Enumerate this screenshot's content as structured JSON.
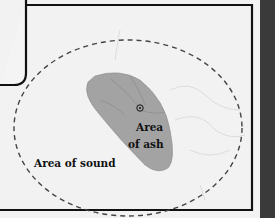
{
  "map": {
    "labels": {
      "sound_area": "Area of sound",
      "ash_area_line1": "Area",
      "ash_area_line2": "of ash"
    },
    "icons": {
      "volcano": "volcano-marker-icon"
    },
    "colors": {
      "background": "#f4f4f4",
      "ash_fill": "#a3a3a3",
      "frame": "#111111",
      "dashed_outline": "#444444",
      "right_strip": "#3a3a3a"
    }
  }
}
